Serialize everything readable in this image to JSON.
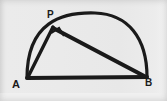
{
  "figure": {
    "kind": "geometry-diagram",
    "background_color": "#e9e9e9",
    "ink_color": "#1a1a1a",
    "canvas": {
      "width": 167,
      "height": 101
    },
    "labels": {
      "a": "A",
      "b": "B",
      "p": "P"
    },
    "points": {
      "a": {
        "x": 27,
        "y": 78
      },
      "b": {
        "x": 147,
        "y": 77
      },
      "p": {
        "x": 53,
        "y": 27
      }
    },
    "segments": [
      {
        "name": "diameter-ab",
        "from": "a",
        "to": "b",
        "stroke_width": 4
      },
      {
        "name": "chord-ap",
        "from": "a",
        "to": "p",
        "stroke_width": 3.4
      },
      {
        "name": "chord-pb",
        "from": "p",
        "to": "b",
        "stroke_width": 4.2
      }
    ],
    "arc": {
      "name": "semicircular-arc-apb",
      "from": "a",
      "to": "b",
      "stroke_width": 3.2,
      "apex": {
        "x": 95,
        "y": 13
      }
    },
    "right_angle_mark": {
      "name": "right-angle-square-at-p",
      "at": "p",
      "size": 10,
      "stroke_width": 2.2
    }
  }
}
